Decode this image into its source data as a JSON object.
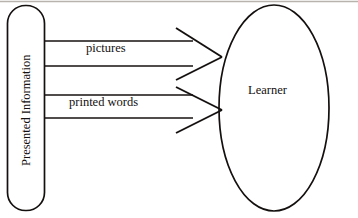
{
  "diagram": {
    "stroke_color": "#14100f",
    "background_color": "#ffffff",
    "source_box": {
      "label": "Presented Information",
      "shape": "rounded-rectangle",
      "orientation": "vertical-text"
    },
    "target_ellipse": {
      "label": "Learner",
      "shape": "ellipse"
    },
    "channels": [
      {
        "label": "pictures",
        "from": "Presented Information",
        "to": "Learner"
      },
      {
        "label": "printed words",
        "from": "Presented Information",
        "to": "Learner"
      }
    ]
  }
}
